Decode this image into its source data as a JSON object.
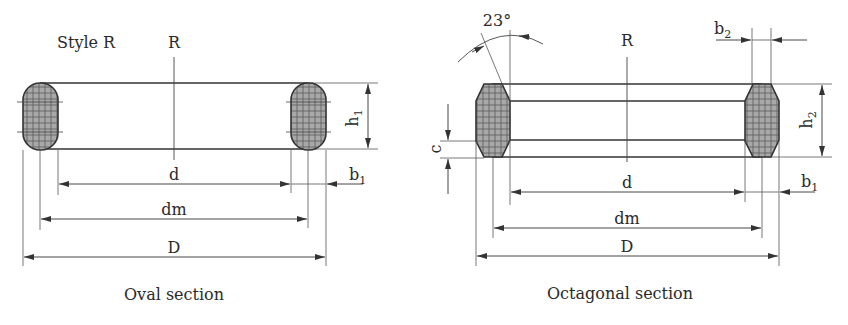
{
  "oval": {
    "style_label": "Style R",
    "centerline_label": "R",
    "height_label": "h",
    "height_sub": "1",
    "width_label": "b",
    "width_sub": "1",
    "inner_diameter_label": "d",
    "mean_diameter_label": "dm",
    "outer_diameter_label": "D",
    "caption": "Oval section"
  },
  "octagonal": {
    "angle_label": "23°",
    "centerline_label": "R",
    "flat_width_label": "b",
    "flat_width_sub": "2",
    "height_label": "h",
    "height_sub": "2",
    "chamfer_label": "c",
    "width_label": "b",
    "width_sub": "1",
    "inner_diameter_label": "d",
    "mean_diameter_label": "dm",
    "outer_diameter_label": "D",
    "caption": "Octagonal section"
  },
  "colors": {
    "line": "#333333",
    "thin_line": "#555555",
    "section_fill": "#9a9a9a",
    "hatch": "#4a4a4a"
  }
}
